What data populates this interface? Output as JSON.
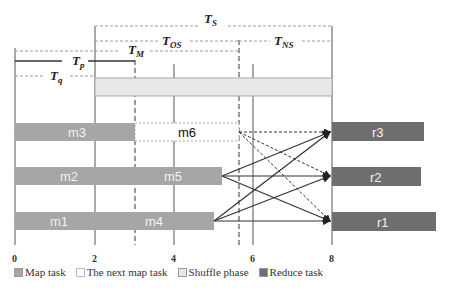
{
  "diagram": {
    "x_axis": {
      "ticks": [
        "0",
        "2",
        "4",
        "6",
        "8"
      ],
      "range": [
        0,
        10.5
      ]
    },
    "intervals": [
      {
        "name": "T_S",
        "main": "T",
        "sub": "S",
        "from": 2,
        "to": 8
      },
      {
        "name": "T_OS",
        "main": "T",
        "sub": "OS",
        "from": 2,
        "to": 5.7
      },
      {
        "name": "T_NS",
        "main": "T",
        "sub": "NS",
        "from": 5.7,
        "to": 8
      },
      {
        "name": "T_M",
        "main": "T",
        "sub": "M",
        "from": 0,
        "to": 3
      },
      {
        "name": "T_p",
        "main": "T",
        "sub": "p",
        "from": 0,
        "to": 3
      },
      {
        "name": "T_q",
        "main": "T",
        "sub": "q",
        "from": 0,
        "to": 2
      }
    ],
    "tasks": {
      "m1": "m1",
      "m2": "m2",
      "m3": "m3",
      "m4": "m4",
      "m5": "m5",
      "m6": "m6",
      "r1": "r1",
      "r2": "r2",
      "r3": "r3"
    },
    "colors": {
      "map": "#a6a6a6",
      "reduce": "#6e6e6e",
      "shuffle": "#e8e8e8",
      "next_map": "#ffffff"
    }
  },
  "legend": {
    "map_task": "Map task",
    "next_map_task": "The next map task",
    "shuffle_phase": "Shuffle phase",
    "reduce_task": "Reduce task"
  }
}
